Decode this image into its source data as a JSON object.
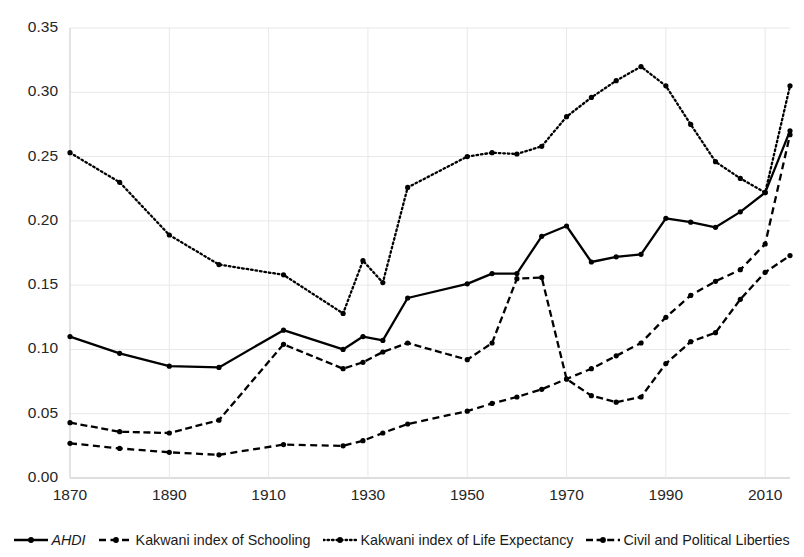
{
  "chart_data": {
    "type": "line",
    "title": "",
    "xlabel": "",
    "ylabel": "",
    "xlim": [
      1870,
      2015
    ],
    "ylim": [
      0.0,
      0.35
    ],
    "grid": true,
    "legend_position": "bottom",
    "y_ticks": [
      "0.00",
      "0.05",
      "0.10",
      "0.15",
      "0.20",
      "0.25",
      "0.30",
      "0.35"
    ],
    "y_tick_values": [
      0.0,
      0.05,
      0.1,
      0.15,
      0.2,
      0.25,
      0.3,
      0.35
    ],
    "x_ticks": [
      "1870",
      "1890",
      "1910",
      "1930",
      "1950",
      "1970",
      "1990",
      "2010"
    ],
    "x_tick_values": [
      1870,
      1890,
      1910,
      1930,
      1950,
      1970,
      1990,
      2010
    ],
    "series": [
      {
        "name": "AHDI",
        "style": "solid",
        "marker": "dot",
        "color": "#000000",
        "x": [
          1870,
          1880,
          1890,
          1900,
          1913,
          1925,
          1929,
          1933,
          1938,
          1950,
          1955,
          1960,
          1965,
          1970,
          1975,
          1980,
          1985,
          1990,
          1995,
          2000,
          2005,
          2010,
          2015
        ],
        "y": [
          0.11,
          0.097,
          0.087,
          0.086,
          0.115,
          0.1,
          0.11,
          0.107,
          0.14,
          0.151,
          0.159,
          0.159,
          0.188,
          0.196,
          0.168,
          0.172,
          0.174,
          0.202,
          0.199,
          0.195,
          0.207,
          0.222,
          0.27
        ]
      },
      {
        "name": "Kakwani index of Schooling",
        "style": "dashed",
        "marker": "dot",
        "color": "#000000",
        "x": [
          1870,
          1880,
          1890,
          1900,
          1913,
          1925,
          1929,
          1933,
          1938,
          1950,
          1955,
          1960,
          1965,
          1970,
          1975,
          1980,
          1985,
          1990,
          1995,
          2000,
          2005,
          2010,
          2015
        ],
        "y": [
          0.027,
          0.023,
          0.02,
          0.018,
          0.026,
          0.025,
          0.029,
          0.035,
          0.042,
          0.052,
          0.058,
          0.063,
          0.069,
          0.077,
          0.085,
          0.095,
          0.105,
          0.125,
          0.142,
          0.153,
          0.162,
          0.182,
          0.267
        ]
      },
      {
        "name": "Kakwani index of Life Expectancy",
        "style": "dotted",
        "marker": "dot",
        "color": "#000000",
        "x": [
          1870,
          1880,
          1890,
          1900,
          1913,
          1925,
          1929,
          1933,
          1938,
          1950,
          1955,
          1960,
          1965,
          1970,
          1975,
          1980,
          1985,
          1990,
          1995,
          2000,
          2005,
          2010,
          2015
        ],
        "y": [
          0.253,
          0.23,
          0.189,
          0.166,
          0.158,
          0.128,
          0.169,
          0.152,
          0.226,
          0.25,
          0.253,
          0.252,
          0.258,
          0.281,
          0.296,
          0.309,
          0.32,
          0.305,
          0.275,
          0.246,
          0.233,
          0.222,
          0.305
        ]
      },
      {
        "name": "Civil and Political Liberties",
        "style": "dashdot",
        "marker": "dot",
        "color": "#000000",
        "x": [
          1870,
          1880,
          1890,
          1900,
          1913,
          1925,
          1929,
          1933,
          1938,
          1950,
          1955,
          1960,
          1965,
          1970,
          1975,
          1980,
          1985,
          1990,
          1995,
          2000,
          2005,
          2010,
          2015
        ],
        "y": [
          0.043,
          0.036,
          0.035,
          0.045,
          0.104,
          0.085,
          0.09,
          0.098,
          0.105,
          0.092,
          0.105,
          0.155,
          0.156,
          0.077,
          0.064,
          0.059,
          0.063,
          0.089,
          0.106,
          0.113,
          0.139,
          0.16,
          0.173
        ]
      }
    ]
  },
  "legend": {
    "items": [
      {
        "label": "AHDI",
        "style": "solid",
        "italic": true
      },
      {
        "label": "Kakwani index of Schooling",
        "style": "dashed",
        "italic": false
      },
      {
        "label": "Kakwani index of Life Expectancy",
        "style": "dotted",
        "italic": false
      },
      {
        "label": "Civil and Political Liberties",
        "style": "dashdot",
        "italic": false
      }
    ]
  },
  "axes": {
    "plot_left": 70,
    "plot_right": 790,
    "plot_top": 28,
    "plot_bottom": 478,
    "gridline_color": "#e8e8e8",
    "axis_color": "#d9d9d9"
  }
}
